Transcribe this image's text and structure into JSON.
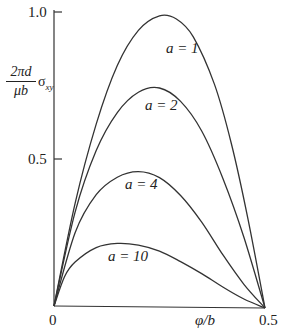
{
  "chart_data": {
    "type": "line",
    "title": "",
    "xlabel": "φ/b",
    "ylabel": "2πd/μb σ_xy",
    "ylabel_parts": {
      "numerator": "2πd",
      "denominator": "μb",
      "symbol": "σ",
      "subscript": "xy"
    },
    "xlim": [
      0,
      0.5
    ],
    "ylim": [
      0,
      1.0
    ],
    "x_ticks": [
      "0",
      "0.5"
    ],
    "y_ticks": [
      "0.5",
      "1.0"
    ],
    "grid": false,
    "legend": "inline labels",
    "series": [
      {
        "name": "a = 1",
        "label": "a = 1",
        "x": [
          0,
          0.05,
          0.1,
          0.15,
          0.2,
          0.25,
          0.29,
          0.33,
          0.38,
          0.42,
          0.46,
          0.5
        ],
        "values": [
          0,
          0.35,
          0.62,
          0.82,
          0.94,
          0.99,
          0.98,
          0.92,
          0.76,
          0.56,
          0.3,
          0
        ]
      },
      {
        "name": "a = 2",
        "label": "a = 2",
        "x": [
          0,
          0.05,
          0.1,
          0.15,
          0.2,
          0.25,
          0.3,
          0.35,
          0.4,
          0.45,
          0.5
        ],
        "values": [
          0,
          0.32,
          0.53,
          0.66,
          0.73,
          0.745,
          0.7,
          0.6,
          0.44,
          0.24,
          0
        ]
      },
      {
        "name": "a = 4",
        "label": "a = 4",
        "x": [
          0,
          0.05,
          0.1,
          0.15,
          0.2,
          0.25,
          0.3,
          0.35,
          0.4,
          0.45,
          0.5
        ],
        "values": [
          0,
          0.25,
          0.38,
          0.44,
          0.46,
          0.44,
          0.38,
          0.29,
          0.18,
          0.08,
          0
        ]
      },
      {
        "name": "a = 10",
        "label": "a = 10",
        "x": [
          0,
          0.025,
          0.05,
          0.1,
          0.15,
          0.2,
          0.25,
          0.3,
          0.35,
          0.4,
          0.45,
          0.5
        ],
        "values": [
          0,
          0.1,
          0.15,
          0.2,
          0.215,
          0.21,
          0.19,
          0.155,
          0.115,
          0.07,
          0.03,
          0
        ]
      }
    ]
  },
  "labels": {
    "y_num": "2πd",
    "y_den": "μb",
    "y_sym": "σ",
    "y_sub": "xy",
    "x_axis": "φ/b",
    "tick_x0": "0",
    "tick_x1": "0.5",
    "tick_y05": "0.5",
    "tick_y10": "1.0",
    "a1": "a = 1",
    "a2": "a = 2",
    "a4": "a = 4",
    "a10": "a = 10"
  },
  "colors": {
    "line": "#333333",
    "axis": "#333333",
    "background": "#ffffff"
  }
}
